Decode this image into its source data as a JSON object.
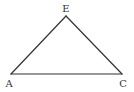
{
  "diagram": {
    "type": "geometry-triangle",
    "stroke_color": "#333333",
    "background": "#ffffff",
    "vertices": [
      {
        "label": "E",
        "x": 66,
        "y": 16,
        "label_x": 66,
        "label_y": 12
      },
      {
        "label": "A",
        "x": 11,
        "y": 74,
        "label_x": 9,
        "label_y": 87
      },
      {
        "label": "C",
        "x": 122,
        "y": 74,
        "label_x": 123,
        "label_y": 87
      }
    ],
    "edges": [
      {
        "from": "A",
        "to": "E"
      },
      {
        "from": "E",
        "to": "C"
      },
      {
        "from": "A",
        "to": "C"
      }
    ]
  }
}
